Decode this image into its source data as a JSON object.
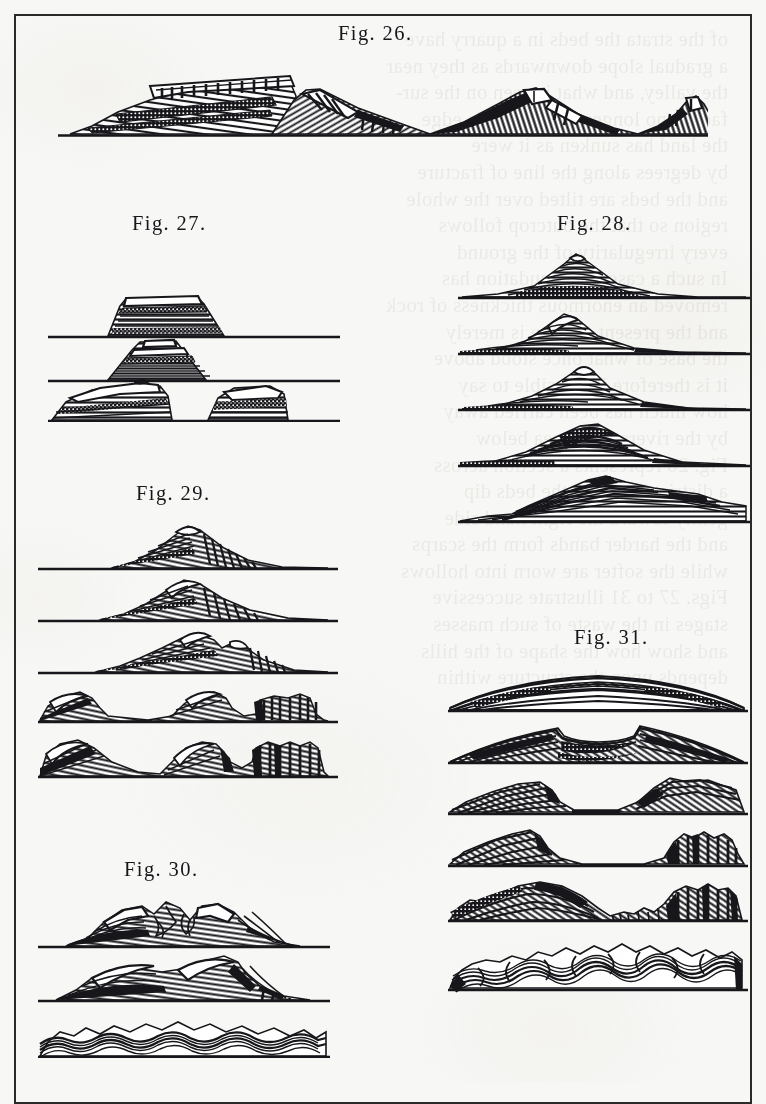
{
  "page": {
    "kind": "engraved-plate",
    "paper_color": "#f7f7f5",
    "ink_color": "#17161a",
    "frame_color": "#2c2a26",
    "width": 766,
    "height": 1083
  },
  "showthrough": {
    "note": "illegible mirrored letterpress bleeding through from the reverse side of the leaf",
    "lines": [
      "of the strata the beds in a quarry have",
      "a gradual slope downwards as they near",
      "the valley, and what is seen on the sur-",
      "face is no longer to the worlds edge",
      "the land has sunken as it were",
      "by degrees along the line of fracture",
      "and the beds are tilted over the whole",
      "region so that the outcrop follows",
      "every irregularity of the ground",
      "In such a case the denudation has",
      "removed an enormous thickness of rock",
      "and the present surface is merely",
      "the base of what once stood above",
      "it is therefore impossible to say",
      "how much has been carried away",
      "by the rivers to the sea below",
      "Fig. 26 represents a section across",
      "a district in which the beds dip",
      "gently toward the right hand side",
      "and the harder bands form the scarps",
      "while the softer are worn into hollows",
      "Figs. 27 to 31 illustrate successive",
      "stages in the waste of such masses",
      "and show how the shape of the hills",
      "depends upon the structure within"
    ]
  },
  "figures": [
    {
      "id": "fig-26",
      "label": "Fig. 26.",
      "label_x": 338,
      "label_y": 22,
      "panels": 1,
      "description": "Long landscape section with an eroded plateau on the left and three successive conical hills to the right, each cut by steeply inclined strata."
    },
    {
      "id": "fig-27",
      "label": "Fig. 27.",
      "label_x": 132,
      "label_y": 212,
      "panels": 3,
      "description": "Three stages in the denudation of a horizontally bedded mesa: capped table mountain, stepped butte, and finally two low separated remnants."
    },
    {
      "id": "fig-28",
      "label": "Fig. 28.",
      "label_x": 557,
      "label_y": 212,
      "panels": 5,
      "description": "Five stages in the destruction of a dome of conformable strata, from a sharp peaked cone down to an obliquely truncated ridge of inclined beds."
    },
    {
      "id": "fig-29",
      "label": "Fig. 29.",
      "label_x": 136,
      "label_y": 482,
      "panels": 5,
      "description": "Five stages in the wasting of an asymmetric ridge whose beds dip steeply to the right, ending in detached escarpments and hog-backs."
    },
    {
      "id": "fig-30",
      "label": "Fig. 30.",
      "label_x": 124,
      "label_y": 858,
      "panels": 3,
      "description": "Three stages in the erosion of closely folded strata, passing into a surface of tightly crumpled contorted beds."
    },
    {
      "id": "fig-31",
      "label": "Fig. 31.",
      "label_x": 574,
      "label_y": 626,
      "panels": 6,
      "description": "Six stages in the denudation of an anticline: the arch is breached, a central valley is excavated between inward facing escarpments, and finally contorted beds are exposed."
    }
  ]
}
